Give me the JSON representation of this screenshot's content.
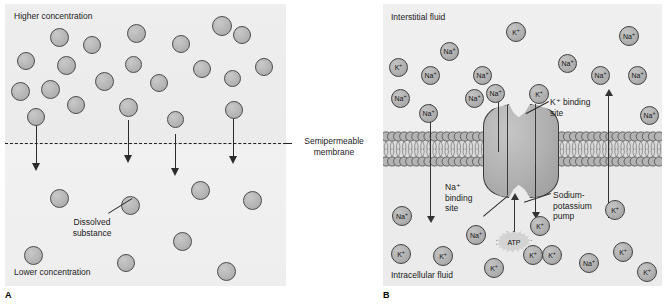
{
  "figure": {
    "panels": [
      {
        "letter": "A",
        "name": "diffusion-across-semipermeable-membrane"
      },
      {
        "letter": "B",
        "name": "sodium-potassium-pump-active-transport"
      }
    ]
  },
  "panel_a": {
    "letter": "A",
    "label_top": "Higher concentration",
    "label_bottom": "Lower concentration",
    "label_membrane_line1": "Semipermeable",
    "label_membrane_line2": "membrane",
    "label_solute_line1": "Dissolved",
    "label_solute_line2": "substance",
    "membrane_style": "dashed",
    "particles_upper": [
      {
        "x": 12,
        "y": 48,
        "d": 18
      },
      {
        "x": 45,
        "y": 24,
        "d": 19
      },
      {
        "x": 78,
        "y": 32,
        "d": 18
      },
      {
        "x": 6,
        "y": 78,
        "d": 19
      },
      {
        "x": 36,
        "y": 76,
        "d": 19
      },
      {
        "x": 52,
        "y": 52,
        "d": 19
      },
      {
        "x": 62,
        "y": 92,
        "d": 18
      },
      {
        "x": 90,
        "y": 68,
        "d": 19
      },
      {
        "x": 22,
        "y": 104,
        "d": 18
      },
      {
        "x": 122,
        "y": 20,
        "d": 19
      },
      {
        "x": 120,
        "y": 52,
        "d": 17
      },
      {
        "x": 145,
        "y": 70,
        "d": 18
      },
      {
        "x": 114,
        "y": 94,
        "d": 19
      },
      {
        "x": 162,
        "y": 107,
        "d": 17
      },
      {
        "x": 167,
        "y": 31,
        "d": 18
      },
      {
        "x": 188,
        "y": 56,
        "d": 18
      },
      {
        "x": 207,
        "y": 12,
        "d": 20
      },
      {
        "x": 228,
        "y": 22,
        "d": 18
      },
      {
        "x": 219,
        "y": 66,
        "d": 17
      },
      {
        "x": 250,
        "y": 54,
        "d": 18
      },
      {
        "x": 220,
        "y": 97,
        "d": 18
      }
    ],
    "particles_lower": [
      {
        "x": 45,
        "y": 185,
        "d": 19
      },
      {
        "x": 116,
        "y": 192,
        "d": 19
      },
      {
        "x": 186,
        "y": 177,
        "d": 19
      },
      {
        "x": 238,
        "y": 187,
        "d": 19
      },
      {
        "x": 19,
        "y": 242,
        "d": 19
      },
      {
        "x": 112,
        "y": 250,
        "d": 18
      },
      {
        "x": 168,
        "y": 228,
        "d": 19
      },
      {
        "x": 212,
        "y": 258,
        "d": 19
      }
    ],
    "arrows": [
      {
        "x": 31,
        "y_start": 122,
        "length": 38
      },
      {
        "x": 123,
        "y_start": 116,
        "length": 36
      },
      {
        "x": 170,
        "y_start": 130,
        "length": 35
      },
      {
        "x": 228,
        "y_start": 115,
        "length": 38
      }
    ]
  },
  "panel_b": {
    "letter": "B",
    "label_top": "Interstitial fluid",
    "label_bottom": "Intracellular fluid",
    "label_k_binding_line1": "K⁺ binding",
    "label_k_binding_line2": "site",
    "label_na_binding_line1": "Na⁺",
    "label_na_binding_line2": "binding",
    "label_na_binding_line3": "site",
    "label_pump_line1": "Sodium-",
    "label_pump_line2": "potassium",
    "label_pump_line3": "pump",
    "label_atp": "ATP",
    "ion_na": "Na",
    "ion_k": "K",
    "ion_charge": "+",
    "ions_extracellular": [
      {
        "ion": "K",
        "x": 6,
        "y": 54,
        "d": 19
      },
      {
        "ion": "Na",
        "x": 57,
        "y": 38,
        "d": 19
      },
      {
        "ion": "Na",
        "x": 38,
        "y": 62,
        "d": 19
      },
      {
        "ion": "Na",
        "x": 8,
        "y": 85,
        "d": 19
      },
      {
        "ion": "Na",
        "x": 36,
        "y": 100,
        "d": 19
      },
      {
        "ion": "Na",
        "x": 90,
        "y": 62,
        "d": 19
      },
      {
        "ion": "Na",
        "x": 82,
        "y": 85,
        "d": 19
      },
      {
        "ion": "Na",
        "x": 103,
        "y": 80,
        "d": 19
      },
      {
        "ion": "K",
        "x": 123,
        "y": 18,
        "d": 20
      },
      {
        "ion": "K",
        "x": 146,
        "y": 80,
        "d": 20
      },
      {
        "ion": "Na",
        "x": 175,
        "y": 50,
        "d": 19
      },
      {
        "ion": "Na",
        "x": 208,
        "y": 62,
        "d": 19
      },
      {
        "ion": "Na",
        "x": 236,
        "y": 22,
        "d": 20
      },
      {
        "ion": "Na",
        "x": 245,
        "y": 62,
        "d": 19
      },
      {
        "ion": "Na",
        "x": 257,
        "y": 102,
        "d": 19
      }
    ],
    "ions_intracellular": [
      {
        "ion": "Na",
        "x": 9,
        "y": 202,
        "d": 20
      },
      {
        "ion": "K",
        "x": 8,
        "y": 240,
        "d": 20
      },
      {
        "ion": "K",
        "x": 50,
        "y": 242,
        "d": 20
      },
      {
        "ion": "Na",
        "x": 83,
        "y": 221,
        "d": 20
      },
      {
        "ion": "K",
        "x": 101,
        "y": 254,
        "d": 20
      },
      {
        "ion": "K",
        "x": 140,
        "y": 241,
        "d": 20
      },
      {
        "ion": "K",
        "x": 159,
        "y": 241,
        "d": 20
      },
      {
        "ion": "K",
        "x": 147,
        "y": 212,
        "d": 20
      },
      {
        "ion": "Na",
        "x": 196,
        "y": 249,
        "d": 20
      },
      {
        "ion": "K",
        "x": 222,
        "y": 196,
        "d": 20
      },
      {
        "ion": "K",
        "x": 230,
        "y": 238,
        "d": 20
      },
      {
        "ion": "K",
        "x": 254,
        "y": 258,
        "d": 20
      }
    ],
    "transport_arrows": [
      {
        "name": "na-influx-arrow",
        "direction": "down",
        "x": 47,
        "y": 100,
        "length": 112
      },
      {
        "name": "na-efflux-arrow",
        "direction": "up",
        "x": 115,
        "y": 88,
        "length": 60
      },
      {
        "name": "k-influx-arrow",
        "direction": "down",
        "x": 152,
        "y": 160,
        "length": 48
      },
      {
        "name": "atp-arrow",
        "direction": "up",
        "x": 131,
        "y": 196,
        "length": 32
      },
      {
        "name": "k-efflux-arrow",
        "direction": "up",
        "x": 225,
        "y": 92,
        "length": 122
      }
    ],
    "membrane": {
      "head_count": 46,
      "head_diameter": 10,
      "bilayer_top_y": 127,
      "bilayer_height": 36
    }
  }
}
